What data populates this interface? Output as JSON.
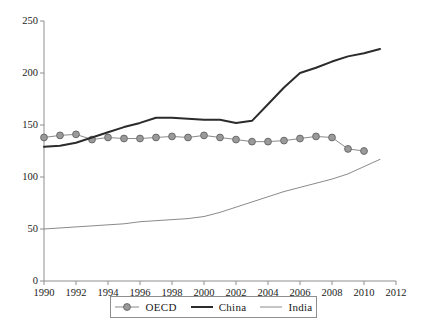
{
  "chart_data": {
    "type": "line",
    "title": "",
    "xlabel": "",
    "ylabel": "",
    "xlim": [
      1990,
      2012
    ],
    "ylim": [
      0,
      250
    ],
    "grid": false,
    "legend_position": "bottom",
    "x_ticks": [
      "1990",
      "1992",
      "1994",
      "1996",
      "1998",
      "2000",
      "2002",
      "2004",
      "2006",
      "2008",
      "2010",
      "2012"
    ],
    "y_ticks": [
      "0",
      "50",
      "100",
      "150",
      "200",
      "250"
    ],
    "x": [
      1990,
      1991,
      1992,
      1993,
      1994,
      1995,
      1996,
      1997,
      1998,
      1999,
      2000,
      2001,
      2002,
      2003,
      2004,
      2005,
      2006,
      2007,
      2008,
      2009,
      2010,
      2011
    ],
    "series": [
      {
        "name": "OECD",
        "color": "#8a8a8a",
        "marker": "circle",
        "marker_fill": "#9a9a9a",
        "line_width": 1,
        "values": [
          138,
          140,
          141,
          136,
          138,
          137,
          137,
          138,
          139,
          138,
          140,
          138,
          136,
          134,
          134,
          135,
          137,
          139,
          138,
          127,
          125,
          null
        ]
      },
      {
        "name": "China",
        "color": "#2b2b2b",
        "marker": "none",
        "line_width": 2,
        "values": [
          129,
          130,
          133,
          138,
          143,
          148,
          152,
          157,
          157,
          156,
          155,
          155,
          152,
          154,
          170,
          186,
          200,
          205,
          211,
          216,
          219,
          223
        ]
      },
      {
        "name": "India",
        "color": "#8a8a8a",
        "marker": "none",
        "line_width": 1,
        "values": [
          50,
          51,
          52,
          53,
          54,
          55,
          57,
          58,
          59,
          60,
          62,
          66,
          71,
          76,
          81,
          86,
          90,
          94,
          98,
          103,
          110,
          117
        ]
      }
    ]
  },
  "legend": {
    "items": [
      {
        "label": "OECD",
        "style": "marker-line"
      },
      {
        "label": "China",
        "style": "thick-line"
      },
      {
        "label": "India",
        "style": "thin-line"
      }
    ]
  },
  "colors": {
    "axis": "#8e8e8e",
    "text": "#1b1b1b",
    "oecd": "#8a8a8a",
    "oecd_marker": "#9a9a9a",
    "china": "#2b2b2b",
    "india": "#8a8a8a",
    "background": "#ffffff"
  }
}
